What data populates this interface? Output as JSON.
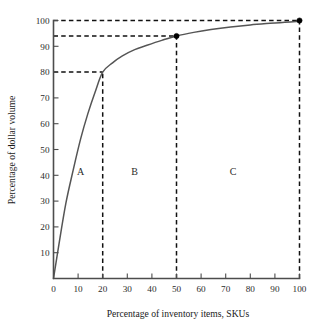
{
  "chart_data": {
    "type": "line",
    "title": "",
    "xlabel": "Percentage of inventory items, SKUs",
    "ylabel": "Percentage of dollar volume",
    "xlim": [
      0,
      100
    ],
    "ylim": [
      0,
      100
    ],
    "grid": false,
    "legend": "none",
    "x_ticks": [
      "0",
      "10",
      "20",
      "30",
      "40",
      "50",
      "60",
      "70",
      "80",
      "90",
      "100"
    ],
    "y_ticks": [
      "10",
      "20",
      "30",
      "40",
      "50",
      "60",
      "70",
      "80",
      "90",
      "100"
    ],
    "x_tick_values": [
      0,
      10,
      20,
      30,
      40,
      50,
      60,
      70,
      80,
      90,
      100
    ],
    "y_tick_values": [
      10,
      20,
      30,
      40,
      50,
      60,
      70,
      80,
      90,
      100
    ],
    "series": [
      {
        "name": "Cumulative dollar volume",
        "x": [
          0,
          2,
          5,
          8,
          11,
          14,
          17,
          20,
          24,
          28,
          33,
          38,
          44,
          50,
          57,
          64,
          72,
          80,
          88,
          94,
          100
        ],
        "values": [
          0,
          12,
          29,
          42,
          54,
          64,
          72.5,
          80,
          83.6,
          86.3,
          88.7,
          90.4,
          92.3,
          94,
          95.4,
          96.5,
          97.5,
          98.3,
          98.9,
          99.3,
          99.7
        ]
      }
    ],
    "markers": [
      {
        "name": "break-point-b-c",
        "x": 50,
        "y": 94
      },
      {
        "name": "end-point",
        "x": 100,
        "y": 100
      }
    ],
    "guides": [
      {
        "name": "guide-h-80",
        "orientation": "horizontal",
        "value": 80,
        "from": 0,
        "to": 20
      },
      {
        "name": "guide-h-94",
        "orientation": "horizontal",
        "value": 94,
        "from": 0,
        "to": 50
      },
      {
        "name": "guide-h-100",
        "orientation": "horizontal",
        "value": 100,
        "from": 0,
        "to": 100
      },
      {
        "name": "guide-v-20",
        "orientation": "vertical",
        "value": 20,
        "from": 0,
        "to": 80
      },
      {
        "name": "guide-v-50",
        "orientation": "vertical",
        "value": 50,
        "from": 0,
        "to": 94
      },
      {
        "name": "guide-v-100",
        "orientation": "vertical",
        "value": 100,
        "from": 0,
        "to": 100
      }
    ],
    "regions": [
      {
        "label": "A",
        "x_start": 0,
        "x_end": 20,
        "label_x": 11,
        "label_y": 40
      },
      {
        "label": "B",
        "x_start": 20,
        "x_end": 50,
        "label_x": 33,
        "label_y": 40
      },
      {
        "label": "C",
        "x_start": 50,
        "x_end": 100,
        "label_x": 73,
        "label_y": 40
      }
    ],
    "colors": {
      "curve": "#555555",
      "axis": "#4d4d4d",
      "guide": "#111111",
      "marker": "#000000",
      "background": "#ffffff"
    }
  }
}
